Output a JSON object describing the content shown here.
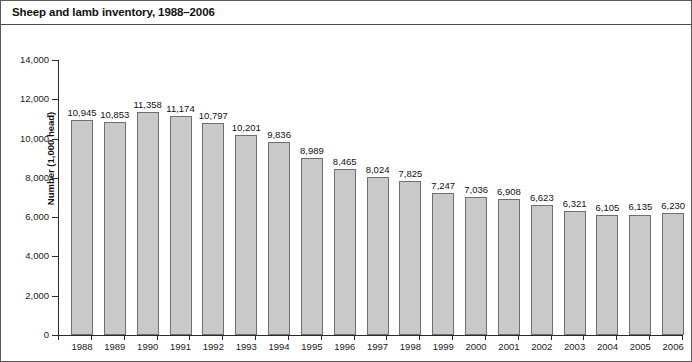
{
  "chart_data": {
    "type": "bar",
    "title": "Sheep and lamb inventory, 1988–2006",
    "xlabel": "",
    "ylabel": "Number (1,000 head)",
    "ylim": [
      0,
      14000
    ],
    "ytick_step": 2000,
    "ytick_labels": [
      "0",
      "2,000",
      "4,000",
      "6,000",
      "8,000",
      "10,000",
      "12,000",
      "14,000"
    ],
    "ytick_values": [
      0,
      2000,
      4000,
      6000,
      8000,
      10000,
      12000,
      14000
    ],
    "grid": false,
    "legend": null,
    "data_labels": true,
    "categories": [
      "1988",
      "1989",
      "1990",
      "1991",
      "1992",
      "1993",
      "1994",
      "1995",
      "1996",
      "1997",
      "1998",
      "1999",
      "2000",
      "2001",
      "2002",
      "2003",
      "2004",
      "2005",
      "2006"
    ],
    "values": [
      10945,
      10853,
      11358,
      11174,
      10797,
      10201,
      9836,
      8989,
      8465,
      8024,
      7825,
      7247,
      7036,
      6908,
      6623,
      6321,
      6105,
      6135,
      6230
    ],
    "value_labels": [
      "10,945",
      "10,853",
      "11,358",
      "11,174",
      "10,797",
      "10,201",
      "9,836",
      "8,989",
      "8,465",
      "8,024",
      "7,825",
      "7,247",
      "7,036",
      "6,908",
      "6,623",
      "6,321",
      "6,105",
      "6,135",
      "6,230"
    ],
    "bar_fill_color": "#c9c9c9",
    "bar_border_color": "#6f6f6f",
    "axis_color": "#2b2b2b",
    "text_color": "#111111"
  }
}
